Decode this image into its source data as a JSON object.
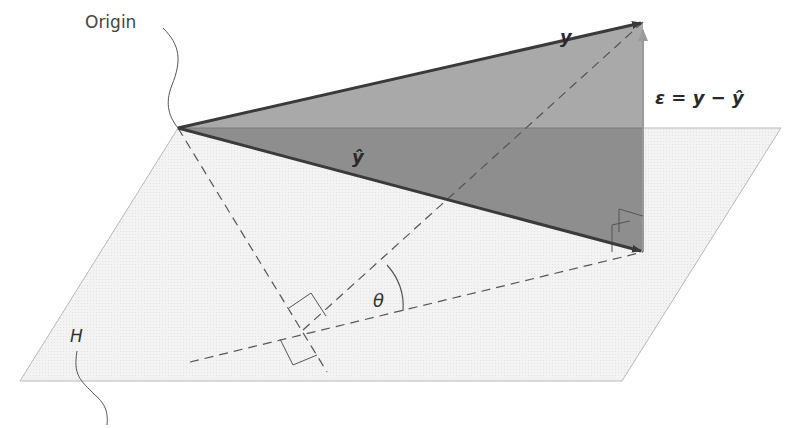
{
  "diagram": {
    "labels": {
      "origin": "Origin",
      "y": "y",
      "epsilon": "ε = y − ŷ",
      "y_hat": "ŷ",
      "theta": "θ",
      "plane": "H"
    },
    "colors": {
      "plane_fill": "#f0f0f0",
      "plane_edge": "#b8b8b8",
      "upper_triangle": "#a9a9a9",
      "lower_triangle": "#8e8e8e",
      "vector_stroke": "#3a3a3a",
      "epsilon_arrow": "#9a9a9a",
      "dashed_line": "#555555"
    },
    "points": {
      "origin": [
        178,
        128
      ],
      "y_tip": [
        643,
        22
      ],
      "y_hat_tip": [
        643,
        252
      ],
      "foot": [
        303,
        330
      ]
    }
  }
}
